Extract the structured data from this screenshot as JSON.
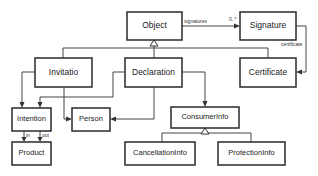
{
  "diagram": {
    "type": "uml-class-diagram",
    "classes": {
      "object": "Object",
      "signature": "Signature",
      "invitatio": "Invitatio",
      "declaration": "Declaration",
      "certificate": "Certificate",
      "intention": "Intention",
      "person": "Person",
      "consumer_info": "ConsumerInfo",
      "product": "Product",
      "cancellation_info": "CancellationInfo",
      "protection_info": "ProtectionInfo"
    },
    "labels": {
      "signatures": "signatures",
      "multiplicity": "0..*",
      "certificate_role": "certificate",
      "in": "in",
      "out": "out"
    },
    "relations": [
      {
        "from": "Invitatio",
        "to": "Object",
        "kind": "generalization"
      },
      {
        "from": "Declaration",
        "to": "Object",
        "kind": "generalization"
      },
      {
        "from": "Certificate",
        "to": "Object",
        "kind": "generalization"
      },
      {
        "from": "Object",
        "to": "Signature",
        "kind": "association",
        "role": "signatures",
        "multiplicity": "0..*"
      },
      {
        "from": "Signature",
        "to": "Certificate",
        "kind": "association",
        "role": "certificate"
      },
      {
        "from": "Invitatio",
        "to": "Intention",
        "kind": "association"
      },
      {
        "from": "Invitatio",
        "to": "Person",
        "kind": "association"
      },
      {
        "from": "Declaration",
        "to": "Intention",
        "kind": "association"
      },
      {
        "from": "Declaration",
        "to": "Person",
        "kind": "association"
      },
      {
        "from": "Declaration",
        "to": "ConsumerInfo",
        "kind": "association"
      },
      {
        "from": "Intention",
        "to": "Product",
        "kind": "association",
        "role": "in"
      },
      {
        "from": "Intention",
        "to": "Product",
        "kind": "association",
        "role": "out"
      },
      {
        "from": "CancellationInfo",
        "to": "ConsumerInfo",
        "kind": "generalization"
      },
      {
        "from": "ProtectionInfo",
        "to": "ConsumerInfo",
        "kind": "generalization"
      }
    ]
  }
}
